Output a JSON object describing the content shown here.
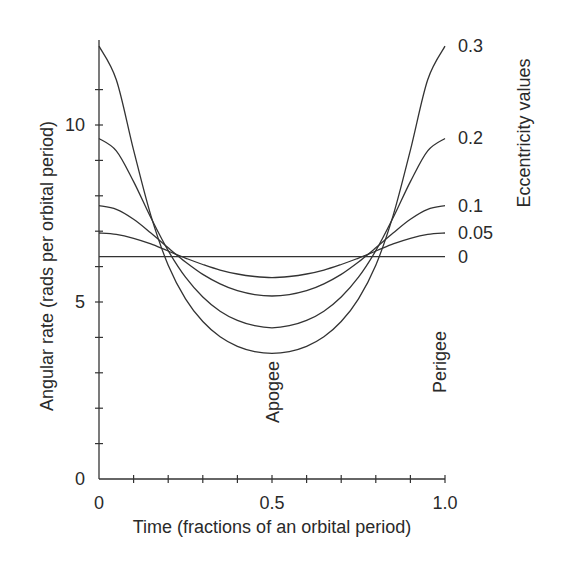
{
  "chart_data": {
    "type": "line",
    "title": "",
    "xlabel": "Time (fractions of an orbital period)",
    "ylabel": "Angular rate (rads per orbital period)",
    "secondary_label": "Eccentricity values",
    "xlim": [
      0,
      1.0
    ],
    "ylim": [
      0,
      12.5
    ],
    "x_tick_labels": [
      "0",
      "0.5",
      "1.0"
    ],
    "x_tick_label_values": [
      0,
      0.5,
      1.0
    ],
    "x_minor_ticks": [
      0.1,
      0.2,
      0.3,
      0.4,
      0.5,
      0.6,
      0.7,
      0.8,
      0.9
    ],
    "y_tick_labels": [
      "0",
      "5",
      "10"
    ],
    "y_tick_label_values": [
      0,
      5,
      10
    ],
    "y_minor_ticks": [
      1,
      2,
      3,
      4,
      5,
      6,
      7,
      8,
      9,
      10,
      11
    ],
    "grid": false,
    "legend_position": "right (inline labels at line ends)",
    "x": [
      0,
      0.05,
      0.1,
      0.15,
      0.2,
      0.25,
      0.3,
      0.35,
      0.4,
      0.45,
      0.5,
      0.55,
      0.6,
      0.65,
      0.7,
      0.75,
      0.8,
      0.85,
      0.9,
      0.95,
      1.0
    ],
    "series": [
      {
        "name": "0.3",
        "eccentricity": 0.3,
        "values": [
          12.23,
          11.28,
          9.29,
          7.44,
          6.04,
          5.09,
          4.45,
          4.02,
          3.75,
          3.6,
          3.55,
          3.6,
          3.75,
          4.02,
          4.45,
          5.09,
          6.04,
          7.44,
          9.29,
          11.28,
          12.23
        ]
      },
      {
        "name": "0.2",
        "eccentricity": 0.2,
        "values": [
          9.62,
          9.27,
          8.4,
          7.38,
          6.45,
          5.7,
          5.14,
          4.74,
          4.48,
          4.33,
          4.27,
          4.33,
          4.48,
          4.74,
          5.14,
          5.7,
          6.45,
          7.38,
          8.4,
          9.27,
          9.62
        ]
      },
      {
        "name": "0.1",
        "eccentricity": 0.1,
        "values": [
          7.72,
          7.62,
          7.34,
          6.95,
          6.53,
          6.13,
          5.78,
          5.51,
          5.32,
          5.21,
          5.17,
          5.21,
          5.32,
          5.51,
          5.78,
          6.13,
          6.53,
          6.95,
          7.34,
          7.62,
          7.72
        ]
      },
      {
        "name": "0.05",
        "eccentricity": 0.05,
        "values": [
          6.95,
          6.91,
          6.8,
          6.64,
          6.44,
          6.24,
          6.06,
          5.9,
          5.79,
          5.72,
          5.69,
          5.72,
          5.79,
          5.9,
          6.06,
          6.24,
          6.44,
          6.64,
          6.8,
          6.91,
          6.95
        ]
      },
      {
        "name": "0",
        "eccentricity": 0,
        "values": [
          6.28,
          6.28,
          6.28,
          6.28,
          6.28,
          6.28,
          6.28,
          6.28,
          6.28,
          6.28,
          6.28,
          6.28,
          6.28,
          6.28,
          6.28,
          6.28,
          6.28,
          6.28,
          6.28,
          6.28,
          6.28
        ]
      }
    ],
    "annotations": [
      {
        "text": "Apogee",
        "x": 0.5,
        "orientation": "vertical"
      },
      {
        "text": "Perigee",
        "x": 1.0,
        "orientation": "vertical"
      }
    ],
    "line_color": "#333333"
  }
}
